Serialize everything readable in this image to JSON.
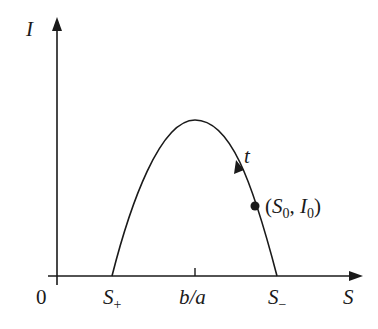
{
  "diagram": {
    "axes": {
      "y_label": "I",
      "x_label": "S",
      "origin_label": "0"
    },
    "ticks": [
      {
        "label": "S",
        "sub": "+"
      },
      {
        "label": "b/a",
        "sub": ""
      },
      {
        "label": "S",
        "sub": "−"
      }
    ],
    "curve": {
      "direction_label": "t",
      "point_label_open": "(",
      "point_label_s": "S",
      "point_label_s_sub": "0",
      "point_label_sep": ", ",
      "point_label_i": "I",
      "point_label_i_sub": "0",
      "point_label_close": ")"
    },
    "colors": {
      "stroke": "#1a1a1a",
      "background": "#ffffff"
    }
  }
}
